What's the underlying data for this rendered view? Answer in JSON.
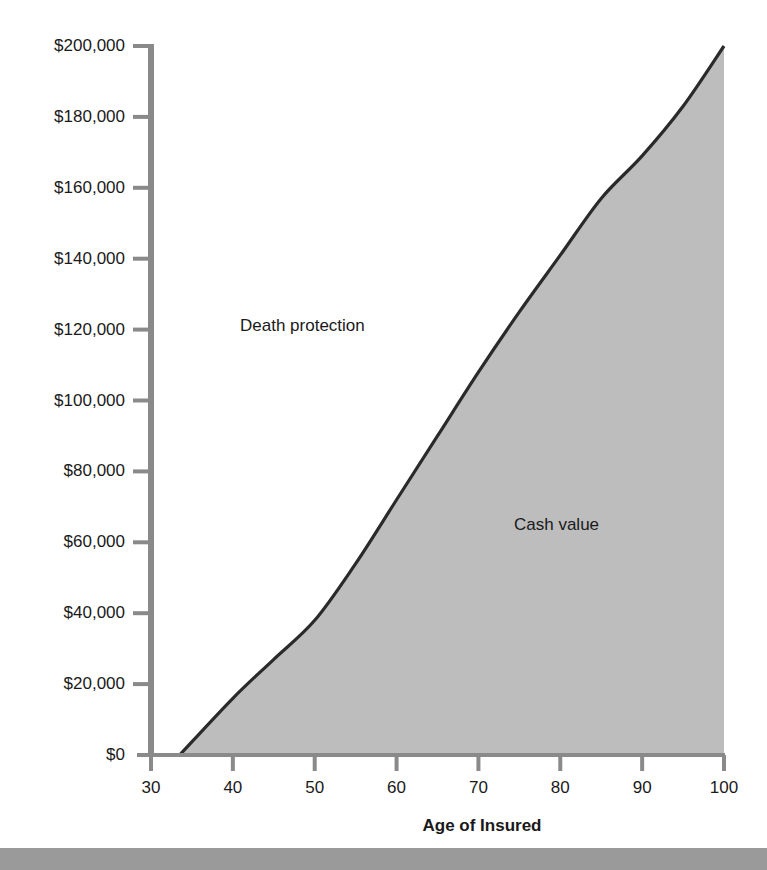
{
  "chart_data": {
    "type": "area",
    "title": "",
    "xlabel": "Age of Insured",
    "ylabel": "",
    "xlim": [
      30,
      100
    ],
    "ylim": [
      0,
      200000
    ],
    "grid": false,
    "legend": null,
    "x_ticks": [
      30,
      40,
      50,
      60,
      70,
      80,
      90,
      100
    ],
    "x_tick_labels": [
      "30",
      "40",
      "50",
      "60",
      "70",
      "80",
      "90",
      "100"
    ],
    "y_ticks": [
      0,
      20000,
      40000,
      60000,
      80000,
      100000,
      120000,
      140000,
      160000,
      180000,
      200000
    ],
    "y_tick_labels": [
      "$0",
      "$20,000",
      "$40,000",
      "$60,000",
      "$80,000",
      "$100,000",
      "$120,000",
      "$140,000",
      "$160,000",
      "$180,000",
      "$200,000"
    ],
    "series": [
      {
        "name": "Cash value",
        "x": [
          33.5,
          40,
          45,
          50,
          55,
          60,
          65,
          70,
          75,
          80,
          85,
          90,
          95,
          100
        ],
        "values": [
          0,
          16000,
          27000,
          38000,
          54000,
          72000,
          90000,
          108000,
          125000,
          141000,
          157000,
          169000,
          183000,
          200000
        ]
      }
    ],
    "annotations": [
      {
        "text": "Death protection",
        "x": 55,
        "y": 121000,
        "region": "above curve"
      },
      {
        "text": "Cash value",
        "x": 82,
        "y": 65000,
        "region": "below curve (shaded)"
      }
    ],
    "colors": {
      "fill": "#bdbdbd",
      "line": "#2a2a2a",
      "axis": "#8a8a8a",
      "bottom_bar": "#9a9a9a"
    }
  }
}
